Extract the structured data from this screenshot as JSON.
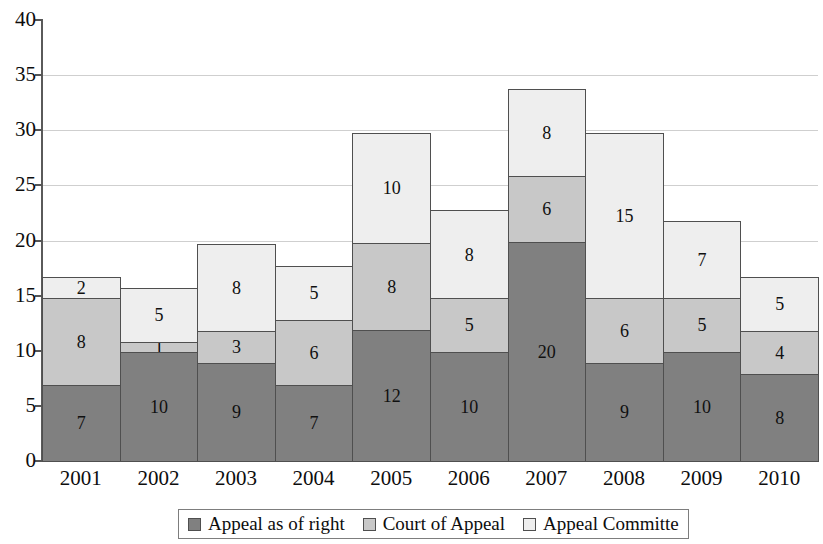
{
  "chart_data": {
    "type": "bar",
    "subtype": "stacked-bar",
    "title": "",
    "xlabel": "",
    "ylabel": "",
    "categories": [
      "2001",
      "2002",
      "2003",
      "2004",
      "2005",
      "2006",
      "2007",
      "2008",
      "2009",
      "2010"
    ],
    "series": [
      {
        "name": "Appeal as of right",
        "color": "#808080",
        "values": [
          7,
          10,
          9,
          7,
          12,
          10,
          20,
          9,
          10,
          8
        ]
      },
      {
        "name": "Court of Appeal",
        "color": "#c8c8c8",
        "values": [
          8,
          1,
          3,
          6,
          8,
          5,
          6,
          6,
          5,
          4
        ]
      },
      {
        "name": "Appeal Committe",
        "color": "#eeeeee",
        "values": [
          2,
          5,
          8,
          5,
          10,
          8,
          8,
          15,
          7,
          5
        ]
      }
    ],
    "totals": [
      17,
      16,
      20,
      18,
      30,
      23,
      34,
      30,
      22,
      17
    ],
    "ylim": [
      0,
      40
    ],
    "yticks": [
      0,
      5,
      10,
      15,
      20,
      25,
      30,
      35,
      40
    ],
    "ytick_labels": [
      "0",
      "5",
      "10",
      "15",
      "20",
      "25",
      "30",
      "35",
      "40"
    ],
    "gridlines": [
      5,
      10,
      15,
      20,
      25,
      30,
      35
    ],
    "grid": true,
    "data_labels": true,
    "legend_position": "bottom",
    "bar_gap": 0
  },
  "legend": {
    "items": [
      {
        "label": "Appeal as of right",
        "color": "#808080"
      },
      {
        "label": "Court of Appeal",
        "color": "#c8c8c8"
      },
      {
        "label": "Appeal Committe",
        "color": "#eeeeee"
      }
    ]
  }
}
